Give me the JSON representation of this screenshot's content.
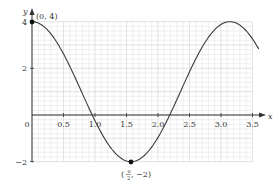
{
  "chart_data": {
    "type": "line",
    "title": "",
    "xlabel": "x",
    "ylabel": "y",
    "xlim": [
      0,
      3.5
    ],
    "ylim": [
      -2,
      4
    ],
    "grid": true,
    "x_ticks": [
      "0.5",
      "1.0",
      "1.5",
      "2.0",
      "2.5",
      "3.0",
      "3.5"
    ],
    "x_tick_values": [
      0.5,
      1.0,
      1.5,
      2.0,
      2.5,
      3.0,
      3.5
    ],
    "y_ticks": [
      "4",
      "2",
      "0",
      "−2"
    ],
    "y_tick_values": [
      4,
      2,
      0,
      -2
    ],
    "origin_label": "0",
    "series": [
      {
        "name": "y = 3cos(2x) + 1",
        "x": [
          0,
          0.25,
          0.5,
          0.75,
          0.955,
          1.0,
          1.25,
          1.571,
          1.75,
          2.0,
          2.186,
          2.25,
          2.5,
          2.75,
          3.0,
          3.142,
          3.25,
          3.5,
          3.6
        ],
        "y": [
          4.0,
          3.63,
          2.62,
          1.21,
          0.0,
          -0.25,
          -1.39,
          -2.0,
          -1.81,
          -0.96,
          0.0,
          0.37,
          1.85,
          3.13,
          3.88,
          4.0,
          3.93,
          3.26,
          2.82
        ]
      }
    ],
    "annotations": [
      {
        "label": "(0, 4)",
        "x": 0,
        "y": 4
      },
      {
        "label": "(π/2, −2)",
        "label_num": "π",
        "label_den": "2",
        "label_rest": ", −2)",
        "x": 1.571,
        "y": -2
      }
    ]
  },
  "labels": {
    "x_axis": "x",
    "y_axis": "y",
    "origin": "0",
    "point_max": "(0, 4)",
    "point_min_open": "(",
    "point_min_num": "π",
    "point_min_den": "2",
    "point_min_rest": ", −2)",
    "xt": [
      "0.5",
      "1.0",
      "1.5",
      "2.0",
      "2.5",
      "3.0",
      "3.5"
    ],
    "yt": [
      "4",
      "2",
      "−2"
    ]
  },
  "colors": {
    "curve": "#3a3a3a",
    "axis": "#333333",
    "grid": "#d9d9d9",
    "point": "#111111"
  }
}
